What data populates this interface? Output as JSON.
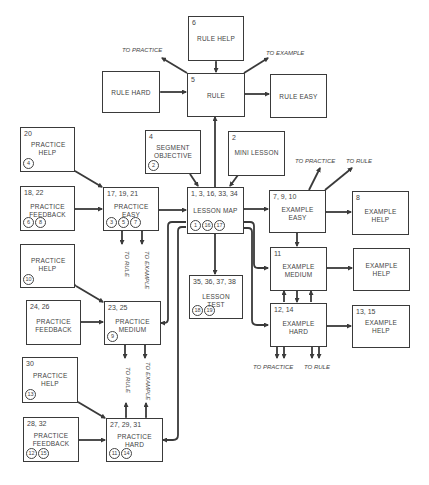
{
  "diagram": {
    "type": "flowchart",
    "boxes": {
      "rule_help": {
        "num": "6",
        "label": "RULE HELP",
        "circles": []
      },
      "rule": {
        "num": "5",
        "label": "RULE",
        "circles": []
      },
      "rule_hard": {
        "num": "",
        "label": "RULE HARD",
        "circles": []
      },
      "rule_easy": {
        "num": "",
        "label": "RULE EASY",
        "circles": []
      },
      "segment_objective": {
        "num": "4",
        "label": "SEGMENT OBJECTIVE",
        "circles": [
          "2"
        ]
      },
      "mini_lesson": {
        "num": "2",
        "label": "MINI LESSON",
        "circles": []
      },
      "lesson_map": {
        "num": "1, 3, 16, 33, 34",
        "label": "LESSON MAP",
        "circles": [
          "1",
          "16",
          "17"
        ]
      },
      "practice_help_1": {
        "num": "20",
        "label": "PRACTICE HELP",
        "circles": [
          "4"
        ]
      },
      "practice_feedback_1": {
        "num": "18, 22",
        "label": "PRACTICE FEEDBACK",
        "circles": [
          "6",
          "8"
        ]
      },
      "practice_easy": {
        "num": "17, 19, 21",
        "label": "PRACTICE EASY",
        "circles": [
          "3",
          "5",
          "7"
        ]
      },
      "example_easy": {
        "num": "7, 9, 10",
        "label": "EXAMPLE EASY",
        "circles": []
      },
      "example_help_1": {
        "num": "8",
        "label": "EXAMPLE HELP",
        "circles": []
      },
      "example_medium": {
        "num": "11",
        "label": "EXAMPLE MEDIUM",
        "circles": []
      },
      "example_help_2": {
        "num": "",
        "label": "EXAMPLE HELP",
        "circles": []
      },
      "example_hard": {
        "num": "12, 14",
        "label": "EXAMPLE HARD",
        "circles": []
      },
      "example_help_3": {
        "num": "13, 15",
        "label": "EXAMPLE HELP",
        "circles": []
      },
      "lesson_test": {
        "num": "35, 36, 37, 38",
        "label": "LESSON TEST",
        "circles": [
          "18",
          "19"
        ]
      },
      "practice_help_2": {
        "num": "",
        "label": "PRACTICE HELP",
        "circles": [
          "10"
        ]
      },
      "practice_feedback_2": {
        "num": "24, 26",
        "label": "PRACTICE FEEDBACK",
        "circles": []
      },
      "practice_medium": {
        "num": "23, 25",
        "label": "PRACTICE MEDIUM",
        "circles": [
          "9"
        ]
      },
      "practice_help_3": {
        "num": "30",
        "label": "PRACTICE HELP",
        "circles": [
          "13"
        ]
      },
      "practice_feedback_3": {
        "num": "28, 32",
        "label": "PRACTICE FEEDBACK",
        "circles": [
          "12",
          "15"
        ]
      },
      "practice_hard": {
        "num": "27, 29, 31",
        "label": "PRACTICE HARD",
        "circles": [
          "11",
          "14"
        ]
      }
    },
    "notes": {
      "rule_to_practice": "TO PRACTICE",
      "rule_to_example": "TO EXAMPLE",
      "example_easy_to_practice": "TO PRACTICE",
      "example_easy_to_rule": "TO RULE",
      "example_hard_to_practice": "TO PRACTICE",
      "example_hard_to_rule": "TO RULE",
      "practice_easy_to_rule": "TO RULE",
      "practice_easy_to_example": "TO EXAMPLE",
      "practice_hard_to_rule": "TO RULE",
      "practice_hard_to_example": "TO EXAMPLE"
    },
    "colors": {
      "line": "#3a3a3a",
      "text": "#444444",
      "background": "#ffffff"
    }
  }
}
